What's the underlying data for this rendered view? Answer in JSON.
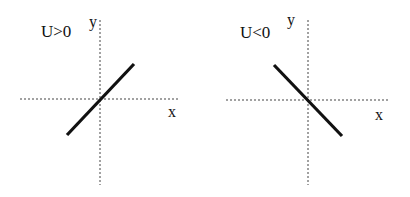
{
  "panels": [
    {
      "condition": "U>0",
      "x_axis_label": "x",
      "y_axis_label": "y",
      "line_slope": "positive"
    },
    {
      "condition": "U<0",
      "x_axis_label": "x",
      "y_axis_label": "y",
      "line_slope": "negative"
    }
  ],
  "colors": {
    "line": "#111111",
    "axis": "#444444",
    "background": "#ffffff"
  }
}
